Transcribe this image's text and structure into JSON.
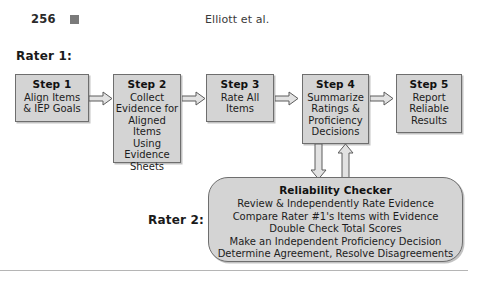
{
  "header": {
    "page_number": "256",
    "marker_icon": "filled-square-icon",
    "running_head": "Elliott et al."
  },
  "labels": {
    "rater1": "Rater 1:",
    "rater2": "Rater 2:"
  },
  "flow": {
    "steps": [
      {
        "title": "Step 1",
        "body": "Align Items\n& IEP Goals"
      },
      {
        "title": "Step 2",
        "body": "Collect\nEvidence for\nAligned Items\nUsing\nEvidence\nSheets"
      },
      {
        "title": "Step 3",
        "body": "Rate All\nItems"
      },
      {
        "title": "Step 4",
        "body": "Summarize\nRatings &\nProficiency\nDecisions"
      },
      {
        "title": "Step 5",
        "body": "Report\nReliable\nResults"
      }
    ],
    "arrows": [
      {
        "name": "arrow-step1-to-step2",
        "direction": "right"
      },
      {
        "name": "arrow-step2-to-step3",
        "direction": "right"
      },
      {
        "name": "arrow-step3-to-step4",
        "direction": "right"
      },
      {
        "name": "arrow-step4-to-step5",
        "direction": "right"
      },
      {
        "name": "arrow-step4-to-reliability",
        "direction": "down"
      },
      {
        "name": "arrow-reliability-to-step4",
        "direction": "up"
      }
    ]
  },
  "reliability_checker": {
    "title": "Reliability Checker",
    "lines": [
      "Review & Independently Rate Evidence",
      "Compare Rater #1's Items with Evidence",
      "Double Check Total Scores",
      "Make an Independent Proficiency Decision",
      "Determine Agreement, Resolve Disagreements"
    ]
  },
  "colors": {
    "box_fill": "#d4d4d4",
    "box_border": "#6e6e6e",
    "text": "#1a1a1a",
    "page_background": "#ffffff"
  }
}
